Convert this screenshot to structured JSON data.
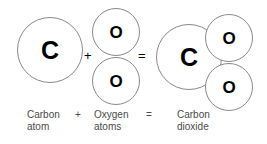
{
  "diagram": {
    "colors": {
      "circle_outline": "#8a8a8a",
      "symbol": "#000000",
      "caption_text": "#4a4a4a",
      "background": "#ffffff"
    },
    "reactants": {
      "carbon": {
        "symbol": "C",
        "caption_line1": "Carbon",
        "caption_line2": "atom"
      },
      "oxygen": {
        "symbol_top": "O",
        "symbol_bottom": "O",
        "caption_line1": "Oxygen",
        "caption_line2": "atoms"
      }
    },
    "product": {
      "carbon_symbol": "C",
      "oxygen_symbol_top": "O",
      "oxygen_symbol_bottom": "O",
      "caption_line1": "Carbon",
      "caption_line2": "dioxide"
    },
    "operators": {
      "plus": "+",
      "equals": "=",
      "caption_plus": "+",
      "caption_equals": "="
    }
  }
}
